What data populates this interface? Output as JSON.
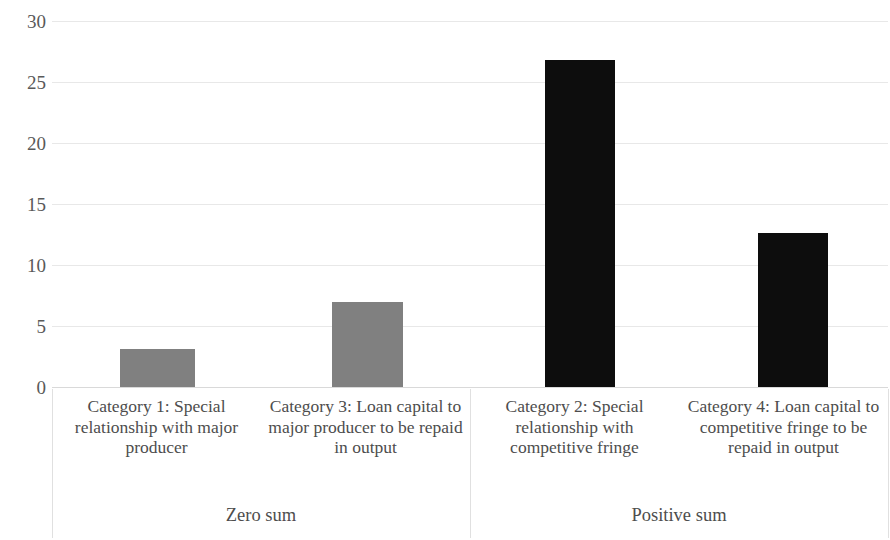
{
  "chart_data": {
    "type": "bar",
    "title": "",
    "subtitle": "",
    "xlabel": "",
    "ylabel": "",
    "ylim": [
      0,
      30
    ],
    "ytick_labels": [
      "30",
      "25",
      "20",
      "15",
      "10",
      "5",
      "0"
    ],
    "ytick_values": [
      30,
      25,
      20,
      15,
      10,
      5,
      0
    ],
    "grid": true,
    "grid_axis": "y",
    "legend": "none",
    "categories": [
      "Category 1: Special relationship with major producer",
      "Category 3: Loan capital to major producer to be repaid in output",
      "Category 2: Special relationship with competitive fringe",
      "Category 4: Loan capital to competitive fringe to be repaid in output"
    ],
    "values": [
      3.1,
      7.0,
      26.8,
      12.6
    ],
    "bar_colors": [
      "#808080",
      "#808080",
      "#0d0d0d",
      "#0d0d0d"
    ],
    "groups": [
      {
        "label": "Zero sum",
        "categories": [
          0,
          1
        ]
      },
      {
        "label": "Positive sum",
        "categories": [
          2,
          3
        ]
      }
    ],
    "group_labels": [
      "Zero sum",
      "Positive sum"
    ]
  },
  "axis": {
    "gridline_color": "#e8e8e8",
    "separator_color": "#e0e0e0",
    "tick_text_color": "#595959",
    "label_text_color": "#4d4d4d"
  },
  "colors": {
    "background": "#ffffff",
    "series_zero_sum": "#808080",
    "series_positive_sum": "#0d0d0d"
  }
}
